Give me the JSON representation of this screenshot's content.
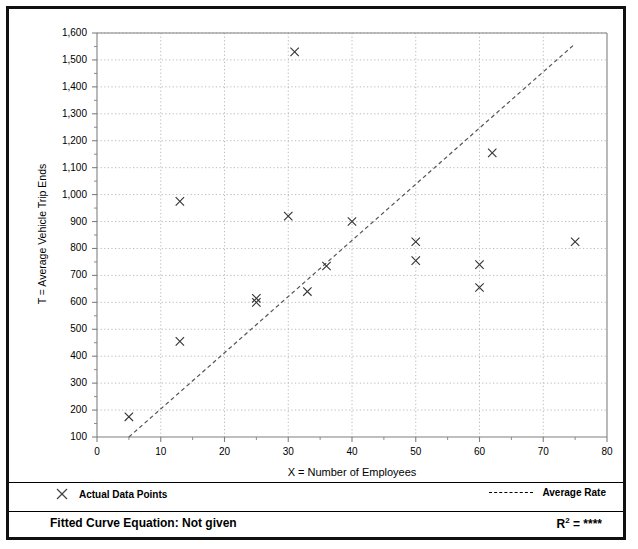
{
  "figure": {
    "y_axis_title": "T = Average Vehicle Trip Ends",
    "x_axis_title": "X = Number of Employees"
  },
  "legend": {
    "points_marker": "x-marker-icon",
    "points_label": "Actual Data Points",
    "rate_marker": "dashed-line-icon",
    "rate_label": "Average Rate"
  },
  "footer": {
    "fitted_label": "Fitted Curve Equation:  Not given",
    "r2_prefix": "R",
    "r2_exponent": "2",
    "r2_value": " = ****"
  },
  "colors": {
    "frame": "#111111",
    "axis": "#808080",
    "grid": "#b0b0b0",
    "marker": "#333333",
    "trend": "#555555"
  },
  "chart_data": {
    "type": "scatter",
    "title": "",
    "xlabel": "X = Number of Employees",
    "ylabel": "T = Average Vehicle Trip Ends",
    "xlim": [
      0,
      80
    ],
    "ylim": [
      100,
      1600
    ],
    "xticks": [
      0,
      10,
      20,
      30,
      40,
      50,
      60,
      70,
      80
    ],
    "yticks": [
      100,
      200,
      300,
      400,
      500,
      600,
      700,
      800,
      900,
      1000,
      1100,
      1200,
      1300,
      1400,
      1500,
      1600
    ],
    "ytick_labels": [
      "100",
      "200",
      "300",
      "400",
      "500",
      "600",
      "700",
      "800",
      "900",
      "1,000",
      "1,100",
      "1,200",
      "1,300",
      "1,400",
      "1,500",
      "1,600"
    ],
    "xtick_labels": [
      "0",
      "10",
      "20",
      "30",
      "40",
      "50",
      "60",
      "70",
      "80"
    ],
    "grid": true,
    "legend_position": "below-axes",
    "series": [
      {
        "name": "Actual Data Points",
        "type": "scatter",
        "marker": "x",
        "points": [
          {
            "x": 5,
            "y": 175
          },
          {
            "x": 13,
            "y": 975
          },
          {
            "x": 13,
            "y": 455
          },
          {
            "x": 25,
            "y": 615
          },
          {
            "x": 25,
            "y": 600
          },
          {
            "x": 31,
            "y": 1530
          },
          {
            "x": 30,
            "y": 920
          },
          {
            "x": 33,
            "y": 640
          },
          {
            "x": 36,
            "y": 735
          },
          {
            "x": 40,
            "y": 900
          },
          {
            "x": 50,
            "y": 825
          },
          {
            "x": 50,
            "y": 755
          },
          {
            "x": 60,
            "y": 740
          },
          {
            "x": 60,
            "y": 655
          },
          {
            "x": 62,
            "y": 1155
          },
          {
            "x": 75,
            "y": 825
          }
        ]
      },
      {
        "name": "Average Rate",
        "type": "line",
        "style": "dashed",
        "points": [
          {
            "x": 5,
            "y": 100
          },
          {
            "x": 75,
            "y": 1560
          }
        ]
      }
    ]
  }
}
